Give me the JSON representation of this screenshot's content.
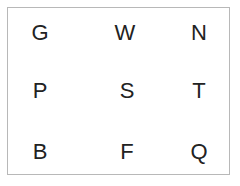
{
  "grid": {
    "rows": [
      [
        "G",
        "W",
        "N"
      ],
      [
        "P",
        "S",
        "T"
      ],
      [
        "B",
        "F",
        "Q"
      ]
    ]
  }
}
